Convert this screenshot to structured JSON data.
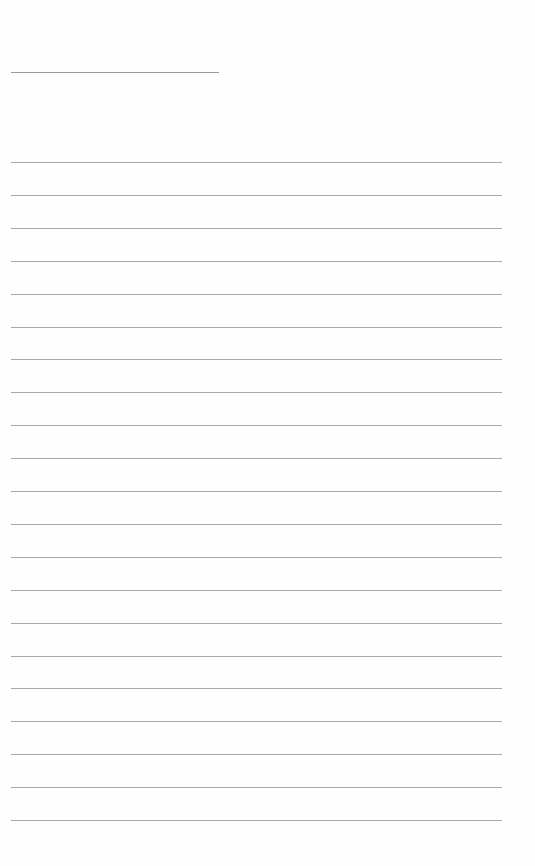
{
  "document": {
    "type": "lined-paper",
    "title_line": {
      "filled": false
    },
    "ruled_lines": {
      "count": 21,
      "first_y": 162,
      "spacing": 32.9,
      "color": "#a8a8a8"
    },
    "background": "#fefefe"
  }
}
